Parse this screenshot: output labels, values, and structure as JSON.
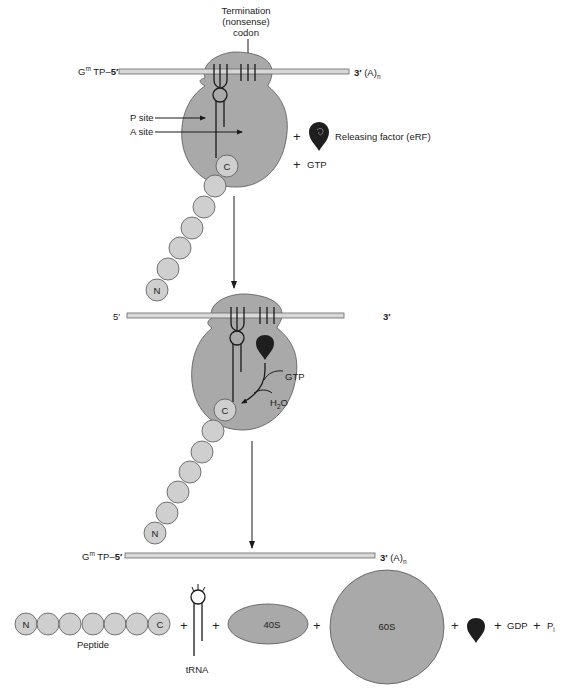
{
  "figure": {
    "panel1": {
      "codon_label": [
        "Termination",
        "(nonsense)",
        "codon"
      ],
      "mrna_left": "G",
      "mrna_left_sup": "m",
      "mrna_left_rest": " TP–",
      "mrna_left_five": "5′",
      "mrna_right_three": "3′",
      "mrna_right_rest": " (A)",
      "mrna_right_sub": "n",
      "p_site": "P site",
      "a_site": "A site",
      "plus1": "+",
      "erf_label": "Releasing factor (eRF)",
      "plus2": "+",
      "gtp": "GTP",
      "c_term": "C",
      "n_term": "N"
    },
    "panel2": {
      "mrna_left_five": "5′",
      "mrna_right_three": "3′",
      "gtp": "GTP",
      "h2o_h": "H",
      "h2o_sub": "2",
      "h2o_o": "O",
      "c_term": "C",
      "n_term": "N"
    },
    "panel3": {
      "mrna_left": "G",
      "mrna_left_sup": "m",
      "mrna_left_rest": " TP–",
      "mrna_left_five": "5′",
      "mrna_right_three": "3′",
      "mrna_right_rest": " (A)",
      "mrna_right_sub": "n",
      "n_term": "N",
      "c_term": "C",
      "peptide_label": "Peptide",
      "trna_label": "tRNA",
      "small_subunit": "40S",
      "large_subunit": "60S",
      "gdp": "GDP",
      "pi": "P",
      "pi_sub": "i",
      "plus": "+"
    }
  },
  "colors": {
    "ribosome": "#a9a9a9",
    "amino_acid": "#cfcfcf",
    "release_factor": "#1e1e1e",
    "mrna": "#d8d8d8"
  }
}
